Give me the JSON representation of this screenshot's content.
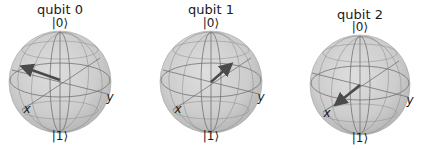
{
  "figure": {
    "type": "bloch_multivector",
    "sphere_color": "#cfcfcf",
    "sphere_edge_color": "#9a9a9a",
    "arrow_color": "#4a4a4a",
    "qubits": [
      {
        "title": "qubit 0",
        "top_label": "|0⟩",
        "bottom_label": "|1⟩",
        "x_label": "x",
        "y_label": "y",
        "center": [
          60,
          82
        ],
        "radius": 50,
        "arrow_tip": [
          22,
          67
        ]
      },
      {
        "title": "qubit 1",
        "top_label": "|0⟩",
        "bottom_label": "|1⟩",
        "x_label": "x",
        "y_label": "y",
        "center": [
          211,
          82
        ],
        "radius": 50,
        "arrow_tip": [
          230,
          65
        ]
      },
      {
        "title": "qubit 2",
        "top_label": "|0⟩",
        "bottom_label": "|1⟩",
        "x_label": "x",
        "y_label": "y",
        "center": [
          360,
          82
        ],
        "radius": 50,
        "arrow_tip": [
          337,
          104
        ]
      }
    ]
  }
}
